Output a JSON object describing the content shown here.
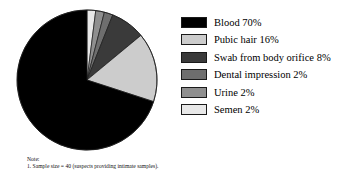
{
  "chart_data": {
    "type": "pie",
    "title": "",
    "categories": [
      "Blood",
      "Pubic hair",
      "Swab from body orifice",
      "Dental impression",
      "Urine",
      "Semen"
    ],
    "values": [
      70,
      16,
      8,
      2,
      2,
      2
    ],
    "value_unit": "%",
    "colors": [
      "#000000",
      "#cccccc",
      "#3a3a3a",
      "#6e6e6e",
      "#8f8f8f",
      "#e8e8e8"
    ],
    "legend_position": "right",
    "start_angle_deg": 0,
    "direction": "clockwise",
    "slice_order_clockwise_from_top": [
      "Semen",
      "Urine",
      "Dental impression",
      "Swab from body orifice",
      "Pubic hair",
      "Blood"
    ],
    "grid": false,
    "labels": [
      "Blood  70%",
      "Pubic hair  16%",
      "Swab from body orifice  8%",
      "Dental impression  2%",
      "Urine  2%",
      "Semen  2%"
    ]
  },
  "legend": {
    "items": [
      {
        "label": "Blood  70%",
        "color": "#000000",
        "name": "blood"
      },
      {
        "label": "Pubic hair  16%",
        "color": "#cccccc",
        "name": "pubic-hair"
      },
      {
        "label": "Swab from body orifice  8%",
        "color": "#3a3a3a",
        "name": "swab-from-body-orifice"
      },
      {
        "label": "Dental impression  2%",
        "color": "#6e6e6e",
        "name": "dental-impression"
      },
      {
        "label": "Urine  2%",
        "color": "#8f8f8f",
        "name": "urine"
      },
      {
        "label": "Semen  2%",
        "color": "#e8e8e8",
        "name": "semen"
      }
    ]
  },
  "note": {
    "heading": "Note:",
    "line1": "1. Sample size = 40 (suspects providing intimate samples)."
  },
  "outline_color": "#1a1a1a"
}
